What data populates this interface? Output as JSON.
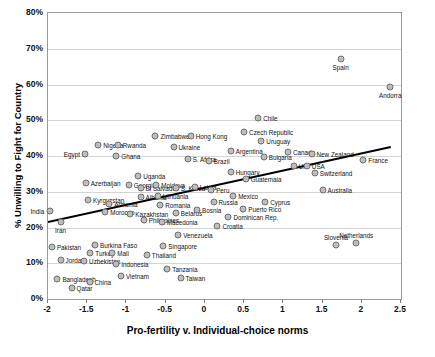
{
  "chart_data": {
    "type": "scatter",
    "title": "",
    "xlabel": "Pro-fertility v. Individual-choice norms",
    "ylabel": "% Unwilling to Fight for Country",
    "xlim": [
      -2,
      2.5
    ],
    "ylim": [
      0,
      0.8
    ],
    "xticks": [
      "-2",
      "-1.5",
      "-1",
      "-0.5",
      "0",
      "0.5",
      "1",
      "1.5",
      "2",
      "2.5"
    ],
    "yticks": [
      "0%",
      "10%",
      "20%",
      "30%",
      "40%",
      "50%",
      "60%",
      "70%",
      "80%"
    ],
    "grid": true,
    "legend": "none",
    "trendline": {
      "x0": -2.0,
      "y0": 0.215,
      "x1": 2.37,
      "y1": 0.425
    },
    "points": [
      {
        "label": "India",
        "x": -1.98,
        "y": 0.245,
        "lp": "left"
      },
      {
        "label": "Iran",
        "x": -1.84,
        "y": 0.215,
        "lp": "below"
      },
      {
        "label": "Pakistan",
        "x": -1.95,
        "y": 0.145,
        "lp": "right"
      },
      {
        "label": "Jordan",
        "x": -1.84,
        "y": 0.108,
        "lp": "right"
      },
      {
        "label": "Bangladesh",
        "x": -1.88,
        "y": 0.055,
        "lp": "right"
      },
      {
        "label": "Qatar",
        "x": -1.7,
        "y": 0.032,
        "lp": "right"
      },
      {
        "label": "Egypt",
        "x": -1.53,
        "y": 0.405,
        "lp": "left"
      },
      {
        "label": "Nigeria",
        "x": -1.36,
        "y": 0.432,
        "lp": "right"
      },
      {
        "label": "Azerbaijan",
        "x": -1.52,
        "y": 0.325,
        "lp": "right"
      },
      {
        "label": "Kyrgyzstan",
        "x": -1.49,
        "y": 0.277,
        "lp": "right"
      },
      {
        "label": "Uzbekistan",
        "x": -1.54,
        "y": 0.105,
        "lp": "right"
      },
      {
        "label": "China",
        "x": -1.47,
        "y": 0.048,
        "lp": "right"
      },
      {
        "label": "Turkey",
        "x": -1.46,
        "y": 0.128,
        "lp": "right"
      },
      {
        "label": "Burkina Faso",
        "x": -1.4,
        "y": 0.15,
        "lp": "right"
      },
      {
        "label": "Morocco",
        "x": -1.27,
        "y": 0.243,
        "lp": "right"
      },
      {
        "label": "Armenia",
        "x": -1.22,
        "y": 0.265,
        "lp": "right"
      },
      {
        "label": "Ghana",
        "x": -1.13,
        "y": 0.4,
        "lp": "right"
      },
      {
        "label": "Rwanda",
        "x": -1.11,
        "y": 0.43,
        "lp": "right"
      },
      {
        "label": "Mali",
        "x": -1.18,
        "y": 0.128,
        "lp": "right"
      },
      {
        "label": "Indonesia",
        "x": -1.13,
        "y": 0.098,
        "lp": "right"
      },
      {
        "label": "Vietnam",
        "x": -1.07,
        "y": 0.065,
        "lp": "right"
      },
      {
        "label": "Kazakhstan",
        "x": -0.95,
        "y": 0.238,
        "lp": "right"
      },
      {
        "label": "Georgia",
        "x": -0.97,
        "y": 0.32,
        "lp": "right"
      },
      {
        "label": "Uganda",
        "x": -0.85,
        "y": 0.345,
        "lp": "right"
      },
      {
        "label": "El Salvador",
        "x": -0.82,
        "y": 0.31,
        "lp": "right"
      },
      {
        "label": "Albania",
        "x": -0.82,
        "y": 0.285,
        "lp": "right"
      },
      {
        "label": "Philippines",
        "x": -0.78,
        "y": 0.222,
        "lp": "right"
      },
      {
        "label": "Thailand",
        "x": -0.74,
        "y": 0.122,
        "lp": "right"
      },
      {
        "label": "Zimbabwe",
        "x": -0.63,
        "y": 0.455,
        "lp": "right"
      },
      {
        "label": "Moldova",
        "x": -0.62,
        "y": 0.318,
        "lp": "right"
      },
      {
        "label": "Lithuania",
        "x": -0.6,
        "y": 0.288,
        "lp": "right"
      },
      {
        "label": "Romania",
        "x": -0.57,
        "y": 0.262,
        "lp": "right"
      },
      {
        "label": "Macedonia",
        "x": -0.55,
        "y": 0.215,
        "lp": "right"
      },
      {
        "label": "Singapore",
        "x": -0.53,
        "y": 0.148,
        "lp": "right"
      },
      {
        "label": "Tanzania",
        "x": -0.48,
        "y": 0.083,
        "lp": "right"
      },
      {
        "label": "Ukraine",
        "x": -0.4,
        "y": 0.425,
        "lp": "right"
      },
      {
        "label": "S. Korea",
        "x": -0.37,
        "y": 0.31,
        "lp": "right"
      },
      {
        "label": "Belarus",
        "x": -0.37,
        "y": 0.24,
        "lp": "right"
      },
      {
        "label": "Venezuela",
        "x": -0.34,
        "y": 0.18,
        "lp": "right"
      },
      {
        "label": "Taiwan",
        "x": -0.31,
        "y": 0.058,
        "lp": "right"
      },
      {
        "label": "S. Africa",
        "x": -0.22,
        "y": 0.392,
        "lp": "right"
      },
      {
        "label": "Hong Kong",
        "x": -0.18,
        "y": 0.455,
        "lp": "right"
      },
      {
        "label": "Latvia",
        "x": -0.13,
        "y": 0.313,
        "lp": "right"
      },
      {
        "label": "Bosnia",
        "x": -0.1,
        "y": 0.248,
        "lp": "right"
      },
      {
        "label": "Brazil",
        "x": 0.05,
        "y": 0.385,
        "lp": "right"
      },
      {
        "label": "Peru",
        "x": 0.08,
        "y": 0.305,
        "lp": "right"
      },
      {
        "label": "Russia",
        "x": 0.11,
        "y": 0.27,
        "lp": "right"
      },
      {
        "label": "Croatia",
        "x": 0.16,
        "y": 0.205,
        "lp": "right"
      },
      {
        "label": "Argentina",
        "x": 0.33,
        "y": 0.415,
        "lp": "right"
      },
      {
        "label": "Hungary",
        "x": 0.33,
        "y": 0.355,
        "lp": "right"
      },
      {
        "label": "Mexico",
        "x": 0.36,
        "y": 0.287,
        "lp": "right"
      },
      {
        "label": "Dominican Rep.",
        "x": 0.3,
        "y": 0.228,
        "lp": "right"
      },
      {
        "label": "Czech Republic",
        "x": 0.5,
        "y": 0.467,
        "lp": "right"
      },
      {
        "label": "Guatemala",
        "x": 0.52,
        "y": 0.335,
        "lp": "right"
      },
      {
        "label": "Puerto Rico",
        "x": 0.49,
        "y": 0.252,
        "lp": "right"
      },
      {
        "label": "Chile",
        "x": 0.68,
        "y": 0.505,
        "lp": "right"
      },
      {
        "label": "Uruguay",
        "x": 0.72,
        "y": 0.443,
        "lp": "right"
      },
      {
        "label": "Bulgaria",
        "x": 0.75,
        "y": 0.398,
        "lp": "right"
      },
      {
        "label": "Cyprus",
        "x": 0.77,
        "y": 0.272,
        "lp": "right"
      },
      {
        "label": "Canada",
        "x": 1.06,
        "y": 0.412,
        "lp": "right"
      },
      {
        "label": "UK",
        "x": 1.13,
        "y": 0.373,
        "lp": "right"
      },
      {
        "label": "USA",
        "x": 1.3,
        "y": 0.372,
        "lp": "right"
      },
      {
        "label": "New Zealand",
        "x": 1.36,
        "y": 0.405,
        "lp": "right"
      },
      {
        "label": "Switzerland",
        "x": 1.4,
        "y": 0.352,
        "lp": "right"
      },
      {
        "label": "Australia",
        "x": 1.5,
        "y": 0.305,
        "lp": "right"
      },
      {
        "label": "Spain",
        "x": 1.73,
        "y": 0.672,
        "lp": "below"
      },
      {
        "label": "Slovenia",
        "x": 1.67,
        "y": 0.152,
        "lp": "above"
      },
      {
        "label": "Netherlands",
        "x": 1.93,
        "y": 0.158,
        "lp": "above"
      },
      {
        "label": "France",
        "x": 2.02,
        "y": 0.39,
        "lp": "right"
      },
      {
        "label": "Andorra",
        "x": 2.36,
        "y": 0.592,
        "lp": "below"
      }
    ]
  }
}
